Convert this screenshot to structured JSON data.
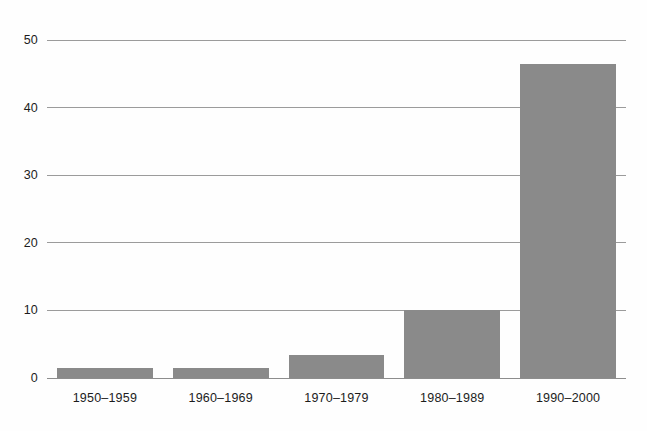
{
  "chart_data": {
    "type": "bar",
    "title": "",
    "subtitle": "",
    "xlabel": "",
    "ylabel": "",
    "categories": [
      "1950–1959",
      "1960–1969",
      "1970–1979",
      "1980–1989",
      "1990–2000"
    ],
    "values": [
      1.5,
      1.5,
      3.4,
      10.0,
      46.5
    ],
    "ylim": [
      0,
      50
    ],
    "yticks": [
      0,
      10,
      20,
      30,
      40,
      50
    ],
    "ytick_labels": [
      "0",
      "10",
      "20",
      "30",
      "40",
      "50"
    ],
    "grid": true,
    "grid_axis": "y",
    "legend": false,
    "legend_position": "none",
    "bar_color": "#8a8a8a",
    "grid_color": "#9b9b9b",
    "axis_color": "#8d8d8d",
    "background_color": "#fefefe",
    "text_color": "#1c1c1c",
    "series": [
      {
        "name": "count",
        "values": [
          1.5,
          1.5,
          3.4,
          10.0,
          46.5
        ]
      }
    ]
  }
}
